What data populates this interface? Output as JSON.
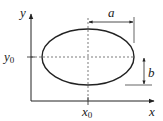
{
  "diagram": {
    "type": "ellipse-parameters",
    "colors": {
      "stroke": "#222222",
      "dashed": "#444444",
      "background": "#ffffff"
    },
    "axes": {
      "x_label": "x",
      "y_label": "y"
    },
    "center": {
      "x_label_base": "x",
      "x_label_sub": "0",
      "y_label_base": "y",
      "y_label_sub": "0"
    },
    "dimensions": {
      "semi_major_label": "a",
      "semi_minor_label": "b"
    }
  }
}
